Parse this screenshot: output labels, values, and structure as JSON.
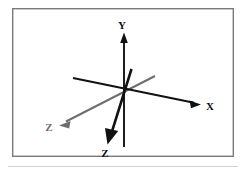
{
  "figure": {
    "name": "3d-coordinate-axes-diagram",
    "background_color": "#ffffff",
    "frame": {
      "stroke_color": "#7a7a7a",
      "fill_color": "#ffffff",
      "x": 12,
      "y": 8,
      "width": 222,
      "height": 149,
      "stroke_width": 1.4
    },
    "separator_rule": {
      "color": "#d0d0d0",
      "x1": 8,
      "x2": 238,
      "y": 166,
      "stroke_width": 1
    },
    "origin": {
      "x": 124,
      "y": 93
    },
    "axes": [
      {
        "id": "y-axis",
        "label": "Y",
        "color": "#111111",
        "stroke_width": 2.0,
        "label_x": 122,
        "label_y": 26,
        "tail_x": 124,
        "tail_y": 147,
        "head_x": 124,
        "head_y": 34,
        "arrow_size": 5.0,
        "direction": "up"
      },
      {
        "id": "x-axis",
        "label": "X",
        "color": "#111111",
        "stroke_width": 2.0,
        "label_x": 209,
        "label_y": 108,
        "tail_x": 73,
        "tail_y": 78,
        "head_x": 199,
        "head_y": 104,
        "arrow_size": 5.5,
        "direction": "down-right"
      },
      {
        "id": "z-axis-gray",
        "label": "Z",
        "color": "#6e6e6e",
        "stroke_width": 2.0,
        "label_x": 49,
        "label_y": 128,
        "tail_x": 155,
        "tail_y": 76,
        "head_x": 61,
        "head_y": 124,
        "arrow_size": 5.5,
        "direction": "down-left"
      },
      {
        "id": "z-axis-black",
        "label": "Z",
        "color": "#111111",
        "stroke_width": 3.2,
        "label_x": 104,
        "label_y": 155,
        "tail_x": 131,
        "tail_y": 70,
        "head_x": 108,
        "head_y": 141,
        "arrow_size": 6.0,
        "direction": "down"
      }
    ]
  },
  "labels": {
    "y": "Y",
    "x": "X",
    "z_gray": "Z",
    "z_black": "Z"
  }
}
